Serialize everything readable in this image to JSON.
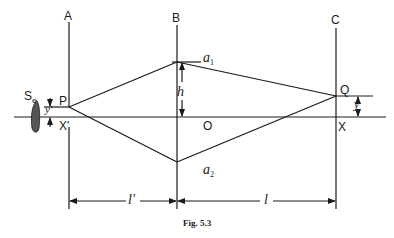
{
  "figure": {
    "caption": "Fig. 5.3",
    "colors": {
      "line": "#1a1a1a",
      "source_fill": "#555555",
      "background": "#ffffff"
    },
    "screens": [
      {
        "label": "A"
      },
      {
        "label": "B"
      },
      {
        "label": "C"
      }
    ],
    "points": {
      "source": "S",
      "source_sub": "e",
      "P": "P",
      "X_prime": "X'",
      "O": "O",
      "a1": "a",
      "a1_sub": "1",
      "a2": "a",
      "a2_sub": "2",
      "Q": "Q",
      "X": "X"
    },
    "dimensions": {
      "h": "h",
      "y_prime": "y'",
      "y": "y",
      "l_prime": "l'",
      "l": "l"
    }
  }
}
